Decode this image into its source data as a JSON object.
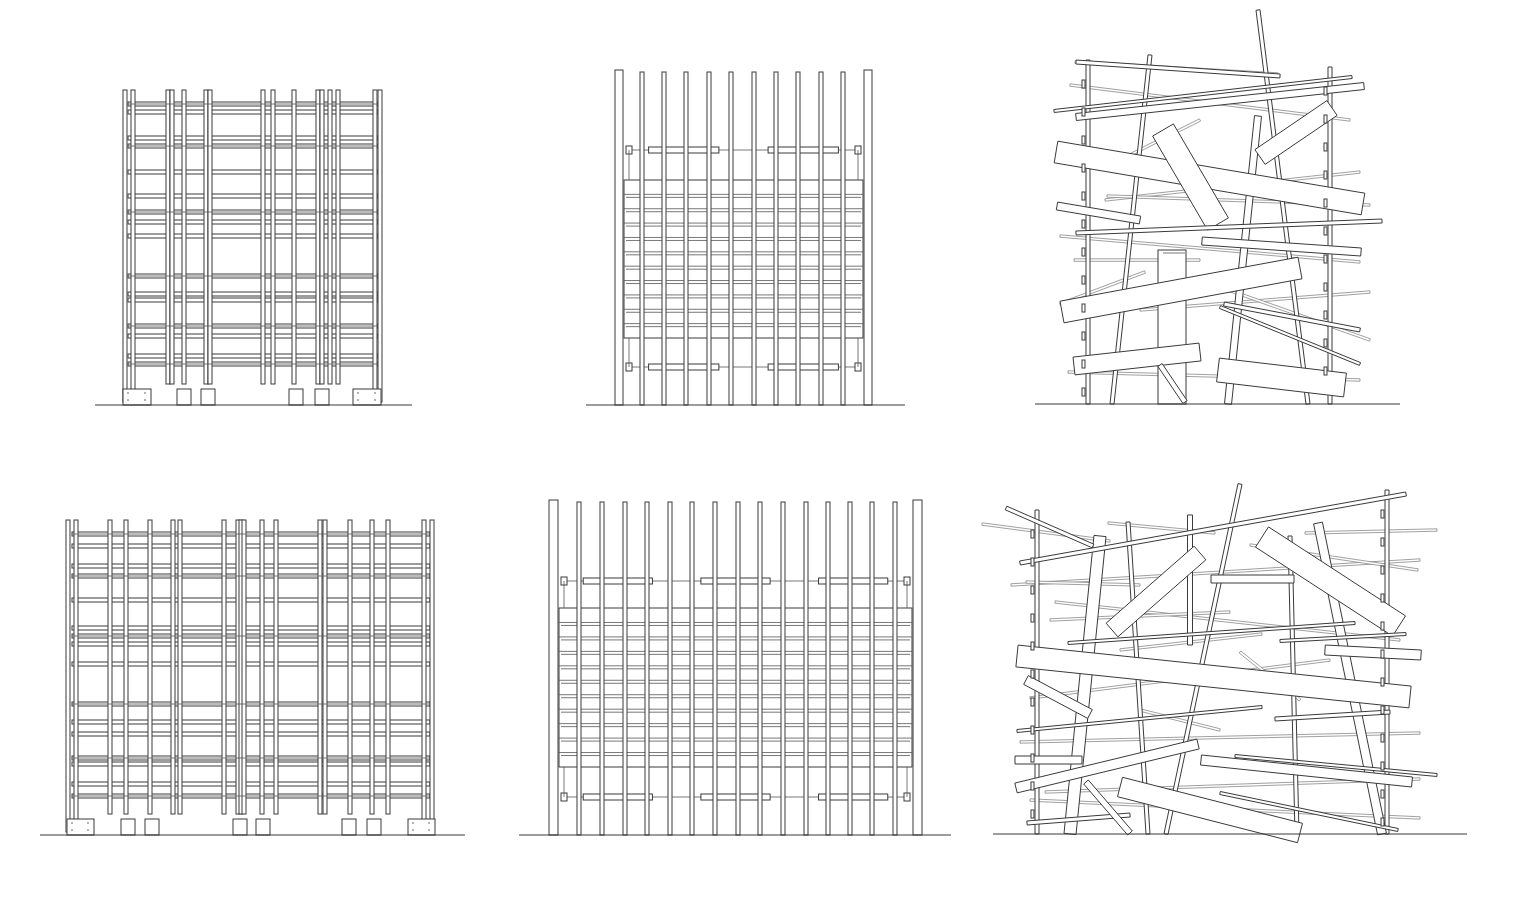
{
  "figure": {
    "background": "#ffffff",
    "ink": "#3a3a3a",
    "panels": [
      {
        "id": "elevation-grid-small",
        "kind": "grid",
        "ground": {
          "x1": 95,
          "x2": 412,
          "y": 405
        },
        "top": 90,
        "bottom": 402,
        "columns": [
          125,
          133,
          168,
          172,
          184,
          206,
          210,
          263,
          273,
          294,
          318,
          322,
          330,
          338,
          375,
          380
        ],
        "tall_columns": [
          125,
          133,
          375,
          380
        ],
        "beams": [
          104,
          112,
          138,
          146,
          172,
          196,
          212,
          222,
          236,
          276,
          294,
          300,
          326,
          336,
          356,
          364
        ],
        "beam_x1": 128,
        "beam_x2": 378,
        "footings": [
          {
            "x": 123,
            "w": 28,
            "h": 16
          },
          {
            "x": 177,
            "w": 14,
            "h": 16
          },
          {
            "x": 201,
            "w": 14,
            "h": 16
          },
          {
            "x": 289,
            "w": 14,
            "h": 16
          },
          {
            "x": 315,
            "w": 14,
            "h": 16
          },
          {
            "x": 353,
            "w": 28,
            "h": 16
          }
        ]
      },
      {
        "id": "elevation-slats-small",
        "kind": "slats",
        "ground": {
          "x1": 586,
          "x2": 905,
          "y": 405
        },
        "top": 70,
        "bottom": 405,
        "end_posts": [
          {
            "x": 615,
            "w": 8
          },
          {
            "x": 864,
            "w": 8
          }
        ],
        "slats": [
          642,
          664,
          686,
          709,
          731,
          754,
          776,
          798,
          821,
          843
        ],
        "slat_w": 4,
        "panel": {
          "x1": 624,
          "x2": 863,
          "y1": 180,
          "y2": 338
        },
        "panel_rows": 11,
        "rails": [
          150,
          367
        ]
      },
      {
        "id": "elevation-scattered-small",
        "kind": "scattered",
        "ground": {
          "x1": 1035,
          "x2": 1400,
          "y": 404
        },
        "posts": [
          {
            "x1": 1088,
            "y1": 60,
            "x2": 1088,
            "y2": 404,
            "w": 4
          },
          {
            "x1": 1330,
            "y1": 67,
            "x2": 1330,
            "y2": 404,
            "w": 4
          },
          {
            "x1": 1150,
            "y1": 55,
            "x2": 1112,
            "y2": 404,
            "w": 4
          },
          {
            "x1": 1258,
            "y1": 10,
            "x2": 1308,
            "y2": 404,
            "w": 4
          },
          {
            "x1": 1258,
            "y1": 116,
            "x2": 1228,
            "y2": 404,
            "w": 7
          }
        ],
        "planks": [
          {
            "x1": 1076,
            "y1": 62,
            "x2": 1280,
            "y2": 76,
            "w": 4
          },
          {
            "x1": 1054,
            "y1": 111,
            "x2": 1352,
            "y2": 77,
            "w": 3
          },
          {
            "x1": 1076,
            "y1": 117,
            "x2": 1364,
            "y2": 86,
            "w": 7
          },
          {
            "x1": 1056,
            "y1": 152,
            "x2": 1363,
            "y2": 204,
            "w": 22
          },
          {
            "x1": 1163,
            "y1": 130,
            "x2": 1218,
            "y2": 224,
            "w": 24
          },
          {
            "x1": 1260,
            "y1": 157,
            "x2": 1332,
            "y2": 108,
            "w": 18
          },
          {
            "x1": 1057,
            "y1": 206,
            "x2": 1140,
            "y2": 220,
            "w": 8
          },
          {
            "x1": 1076,
            "y1": 233,
            "x2": 1382,
            "y2": 221,
            "w": 4
          },
          {
            "x1": 1202,
            "y1": 241,
            "x2": 1361,
            "y2": 252,
            "w": 8
          },
          {
            "x1": 1062,
            "y1": 312,
            "x2": 1300,
            "y2": 268,
            "w": 22
          },
          {
            "x1": 1224,
            "y1": 304,
            "x2": 1360,
            "y2": 330,
            "w": 4
          },
          {
            "x1": 1220,
            "y1": 307,
            "x2": 1360,
            "y2": 364,
            "w": 3
          },
          {
            "x1": 1074,
            "y1": 366,
            "x2": 1200,
            "y2": 352,
            "w": 18
          },
          {
            "x1": 1218,
            "y1": 370,
            "x2": 1345,
            "y2": 385,
            "w": 24
          },
          {
            "x1": 1160,
            "y1": 365,
            "x2": 1185,
            "y2": 402,
            "w": 5
          },
          {
            "x1": 1163,
            "y1": 253,
            "x2": 1185,
            "y2": 253,
            "w": 0
          }
        ],
        "box": {
          "x": 1158,
          "y": 250,
          "w": 28,
          "h": 154
        },
        "thin_lines": [
          {
            "x1": 1075,
            "y1": 62,
            "x2": 1278,
            "y2": 74
          },
          {
            "x1": 1070,
            "y1": 85,
            "x2": 1350,
            "y2": 120
          },
          {
            "x1": 1110,
            "y1": 165,
            "x2": 1200,
            "y2": 120
          },
          {
            "x1": 1105,
            "y1": 200,
            "x2": 1360,
            "y2": 172
          },
          {
            "x1": 1107,
            "y1": 196,
            "x2": 1370,
            "y2": 205
          },
          {
            "x1": 1060,
            "y1": 236,
            "x2": 1360,
            "y2": 262
          },
          {
            "x1": 1074,
            "y1": 260,
            "x2": 1200,
            "y2": 260
          },
          {
            "x1": 1060,
            "y1": 304,
            "x2": 1145,
            "y2": 272
          },
          {
            "x1": 1140,
            "y1": 310,
            "x2": 1370,
            "y2": 292
          },
          {
            "x1": 1068,
            "y1": 372,
            "x2": 1360,
            "y2": 380
          },
          {
            "x1": 1200,
            "y1": 280,
            "x2": 1370,
            "y2": 340
          }
        ]
      },
      {
        "id": "elevation-grid-large",
        "kind": "grid",
        "ground": {
          "x1": 40,
          "x2": 465,
          "y": 835
        },
        "top": 520,
        "bottom": 832,
        "columns": [
          68,
          76,
          110,
          126,
          150,
          173,
          180,
          224,
          238,
          241,
          244,
          262,
          276,
          320,
          325,
          350,
          372,
          388,
          424,
          432
        ],
        "tall_columns": [
          68,
          76,
          424,
          432
        ],
        "beams": [
          534,
          546,
          566,
          576,
          600,
          628,
          636,
          644,
          664,
          704,
          722,
          734,
          758,
          764,
          784,
          796
        ],
        "beam_x1": 72,
        "beam_x2": 430,
        "footings": [
          {
            "x": 67,
            "w": 27,
            "h": 16
          },
          {
            "x": 121,
            "w": 14,
            "h": 16
          },
          {
            "x": 145,
            "w": 14,
            "h": 16
          },
          {
            "x": 233,
            "w": 14,
            "h": 16
          },
          {
            "x": 256,
            "w": 14,
            "h": 16
          },
          {
            "x": 342,
            "w": 14,
            "h": 16
          },
          {
            "x": 367,
            "w": 14,
            "h": 16
          },
          {
            "x": 408,
            "w": 27,
            "h": 16
          }
        ]
      },
      {
        "id": "elevation-slats-large",
        "kind": "slats",
        "ground": {
          "x1": 519,
          "x2": 951,
          "y": 835
        },
        "top": 500,
        "bottom": 835,
        "end_posts": [
          {
            "x": 549,
            "w": 9
          },
          {
            "x": 913,
            "w": 9
          }
        ],
        "slats": [
          579,
          602,
          625,
          647,
          670,
          692,
          715,
          738,
          760,
          783,
          806,
          828,
          850,
          872,
          895
        ],
        "slat_w": 4,
        "panel": {
          "x1": 559,
          "x2": 912,
          "y1": 608,
          "y2": 767
        },
        "panel_rows": 11,
        "rails": [
          581,
          797
        ]
      },
      {
        "id": "elevation-scattered-large",
        "kind": "scattered",
        "ground": {
          "x1": 993,
          "x2": 1467,
          "y": 834
        },
        "posts": [
          {
            "x1": 1037,
            "y1": 510,
            "x2": 1037,
            "y2": 834,
            "w": 4
          },
          {
            "x1": 1387,
            "y1": 490,
            "x2": 1387,
            "y2": 834,
            "w": 4
          },
          {
            "x1": 1128,
            "y1": 522,
            "x2": 1148,
            "y2": 834,
            "w": 4
          },
          {
            "x1": 1190,
            "y1": 515,
            "x2": 1190,
            "y2": 645,
            "w": 5
          },
          {
            "x1": 1240,
            "y1": 484,
            "x2": 1166,
            "y2": 834,
            "w": 4
          },
          {
            "x1": 1290,
            "y1": 536,
            "x2": 1297,
            "y2": 834,
            "w": 4
          },
          {
            "x1": 1318,
            "y1": 523,
            "x2": 1382,
            "y2": 834,
            "w": 9
          },
          {
            "x1": 1100,
            "y1": 536,
            "x2": 1070,
            "y2": 834,
            "w": 12
          }
        ],
        "planks": [
          {
            "x1": 1006,
            "y1": 508,
            "x2": 1093,
            "y2": 546,
            "w": 4
          },
          {
            "x1": 1020,
            "y1": 563,
            "x2": 1406,
            "y2": 494,
            "w": 4
          },
          {
            "x1": 1112,
            "y1": 630,
            "x2": 1200,
            "y2": 553,
            "w": 18
          },
          {
            "x1": 1262,
            "y1": 537,
            "x2": 1399,
            "y2": 626,
            "w": 24
          },
          {
            "x1": 1211,
            "y1": 579,
            "x2": 1294,
            "y2": 579,
            "w": 8
          },
          {
            "x1": 1068,
            "y1": 643,
            "x2": 1355,
            "y2": 623,
            "w": 3
          },
          {
            "x1": 1280,
            "y1": 641,
            "x2": 1406,
            "y2": 634,
            "w": 3
          },
          {
            "x1": 1325,
            "y1": 650,
            "x2": 1421,
            "y2": 655,
            "w": 10
          },
          {
            "x1": 1017,
            "y1": 656,
            "x2": 1410,
            "y2": 697,
            "w": 22
          },
          {
            "x1": 1026,
            "y1": 680,
            "x2": 1090,
            "y2": 714,
            "w": 10
          },
          {
            "x1": 1017,
            "y1": 731,
            "x2": 1262,
            "y2": 707,
            "w": 3
          },
          {
            "x1": 1275,
            "y1": 719,
            "x2": 1390,
            "y2": 712,
            "w": 4
          },
          {
            "x1": 1015,
            "y1": 760,
            "x2": 1082,
            "y2": 760,
            "w": 8
          },
          {
            "x1": 1016,
            "y1": 788,
            "x2": 1198,
            "y2": 744,
            "w": 10
          },
          {
            "x1": 1201,
            "y1": 760,
            "x2": 1412,
            "y2": 782,
            "w": 10
          },
          {
            "x1": 1235,
            "y1": 756,
            "x2": 1437,
            "y2": 775,
            "w": 3
          },
          {
            "x1": 1120,
            "y1": 787,
            "x2": 1300,
            "y2": 833,
            "w": 20
          },
          {
            "x1": 1220,
            "y1": 793,
            "x2": 1398,
            "y2": 830,
            "w": 3
          },
          {
            "x1": 1027,
            "y1": 823,
            "x2": 1130,
            "y2": 815,
            "w": 4
          },
          {
            "x1": 1086,
            "y1": 782,
            "x2": 1130,
            "y2": 833,
            "w": 6
          }
        ],
        "box": null,
        "thin_lines": [
          {
            "x1": 982,
            "y1": 524,
            "x2": 1110,
            "y2": 541
          },
          {
            "x1": 1108,
            "y1": 523,
            "x2": 1215,
            "y2": 533
          },
          {
            "x1": 1305,
            "y1": 533,
            "x2": 1437,
            "y2": 530
          },
          {
            "x1": 1011,
            "y1": 585,
            "x2": 1420,
            "y2": 560
          },
          {
            "x1": 1250,
            "y1": 545,
            "x2": 1418,
            "y2": 570
          },
          {
            "x1": 1026,
            "y1": 582,
            "x2": 1140,
            "y2": 585
          },
          {
            "x1": 1055,
            "y1": 602,
            "x2": 1400,
            "y2": 640
          },
          {
            "x1": 1050,
            "y1": 620,
            "x2": 1230,
            "y2": 612
          },
          {
            "x1": 1120,
            "y1": 650,
            "x2": 1262,
            "y2": 634
          },
          {
            "x1": 1030,
            "y1": 698,
            "x2": 1330,
            "y2": 660
          },
          {
            "x1": 1020,
            "y1": 742,
            "x2": 1420,
            "y2": 733
          },
          {
            "x1": 1045,
            "y1": 792,
            "x2": 1420,
            "y2": 779
          },
          {
            "x1": 1030,
            "y1": 800,
            "x2": 1420,
            "y2": 818
          },
          {
            "x1": 1240,
            "y1": 652,
            "x2": 1300,
            "y2": 700
          },
          {
            "x1": 1140,
            "y1": 710,
            "x2": 1220,
            "y2": 730
          }
        ]
      }
    ]
  }
}
